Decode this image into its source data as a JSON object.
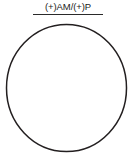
{
  "figure": {
    "label": {
      "text": "(+)AM/(+)P",
      "has_underline": true,
      "color": "#1b1b1b",
      "rule_color": "#2a2a2a"
    },
    "shape": {
      "kind": "circle",
      "stroke_color": "#231f20",
      "fill_color": "#ffffff",
      "stroke_width": "1.5"
    },
    "background_color": "#ffffff"
  }
}
